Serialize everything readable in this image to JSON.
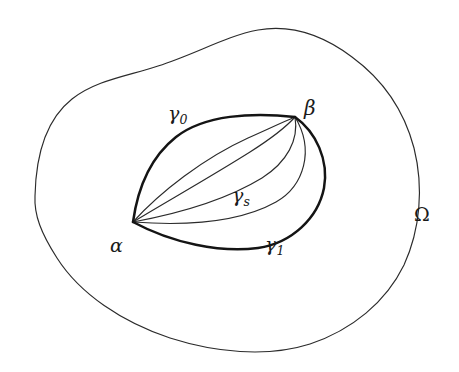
{
  "figure": {
    "background_color": "#ffffff",
    "width": 459,
    "height": 372,
    "stroke_color_thin": "#2b2b2b",
    "stroke_color_bold": "#141414"
  },
  "labels": {
    "domain": {
      "text": "Ω",
      "x": 423,
      "y": 217
    },
    "point_alpha": {
      "text": "α",
      "x": 118,
      "y": 248
    },
    "point_beta": {
      "text": "β",
      "x": 312,
      "y": 110
    },
    "curve_gamma_0": {
      "base": "γ",
      "sub": "0",
      "x": 184,
      "y": 117
    },
    "curve_gamma_1": {
      "base": "γ",
      "sub": "1",
      "x": 279,
      "y": 247
    },
    "curve_gamma_s": {
      "base": "γ",
      "sub": "s",
      "x": 246,
      "y": 198
    }
  },
  "geometry": {
    "endpoint_alpha": {
      "x": 133,
      "y": 222
    },
    "endpoint_beta": {
      "x": 295,
      "y": 117
    },
    "omega_boundary": "M 35 196 C 36 150 48 118 72 99 C 96 80 128 76 158 66 C 196 54 226 36 258 30 C 292 24 324 36 352 57 C 382 79 404 110 414 148 C 424 188 420 230 404 265 C 386 302 352 330 310 344 C 266 358 214 352 170 338 C 122 322 80 294 57 258 C 41 233 34 215 35 196 Z",
    "curve_gamma_0": "M 133 222 C 138 186 152 156 176 137 C 204 115 252 112 295 117",
    "curve_gamma_1": "M 133 222 C 172 243 220 253 258 248 C 292 243 318 218 324 188 C 329 160 316 132 295 117",
    "intermediate_curves": [
      "M 133 222 C 160 192 204 158 248 138 C 266 130 283 122 295 117",
      "M 133 222 C 166 202 212 176 250 152 C 272 138 287 126 295 117",
      "M 133 222 C 176 214 226 200 262 178 C 287 162 299 140 295 117",
      "M 133 222 C 186 226 240 222 276 202 C 304 186 315 150 295 117"
    ],
    "intermediate_curve_count": 4
  },
  "description": {
    "summary": "A simple closed region Ω contains a family of curves from α to β.",
    "boundary_curves": [
      "γ₀",
      "γ₁"
    ],
    "family_parameter": "s"
  }
}
